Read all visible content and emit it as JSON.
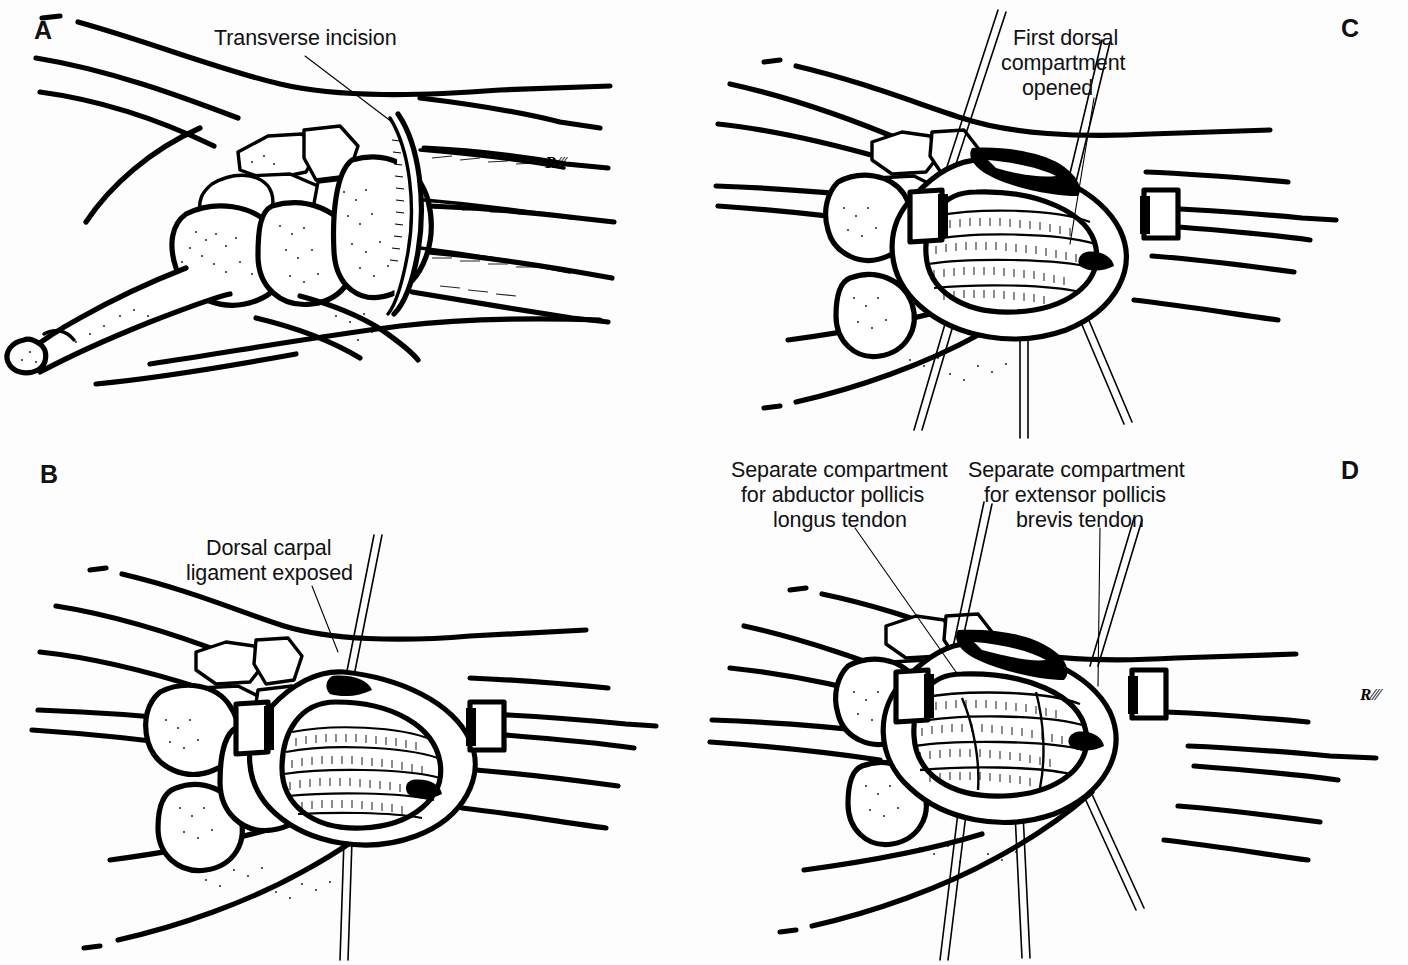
{
  "figure": {
    "background_color": "#ffffff",
    "ink_color": "#000000",
    "panels": [
      {
        "id": "a",
        "letter": "A",
        "letter_pos": {
          "x": 34,
          "y": 18
        },
        "callouts": [
          {
            "name": "transverse-incision",
            "lines": [
              "Transverse incision"
            ],
            "x": 214,
            "y": 26,
            "leader": {
              "x1": 305,
              "y1": 56,
              "x2": 392,
              "y2": 122
            }
          }
        ],
        "signature": "R.M.K.",
        "signature_pos": {
          "x": 545,
          "y": 168
        },
        "description": "Dorsal view of wrist skeleton and forearm with curved transverse skin incision marked over the radial styloid"
      },
      {
        "id": "b",
        "letter": "B",
        "letter_pos": {
          "x": 40,
          "y": 462
        },
        "callouts": [
          {
            "name": "dorsal-carpal-ligament-exposed",
            "lines": [
              "Dorsal carpal",
              "ligament exposed"
            ],
            "x": 206,
            "y": 536,
            "leader": {
              "x1": 312,
              "y1": 586,
              "x2": 338,
              "y2": 652
            }
          }
        ],
        "signature": null,
        "description": "Wound retracted with skin hooks exposing the striped dorsal carpal ligament"
      },
      {
        "id": "c",
        "letter": "C",
        "letter_pos": {
          "x": 1341,
          "y": 16
        },
        "callouts": [
          {
            "name": "first-dorsal-compartment-opened",
            "lines": [
              "First dorsal",
              "compartment",
              "opened"
            ],
            "x": 1013,
            "y": 26,
            "leader": {
              "x1": 1094,
              "y1": 98,
              "x2": 1070,
              "y2": 244
            }
          }
        ],
        "signature": null,
        "description": "First dorsal compartment incised and opened, tendons visible beneath the retinaculum"
      },
      {
        "id": "d",
        "letter": "D",
        "letter_pos": {
          "x": 1341,
          "y": 458
        },
        "callouts": [
          {
            "name": "abductor-pollicis-longus-compartment",
            "lines": [
              "Separate compartment",
              "for abductor pollicis",
              "longus tendon"
            ],
            "x": 731,
            "y": 458,
            "leader": {
              "x1": 855,
              "y1": 528,
              "x2": 956,
              "y2": 672
            }
          },
          {
            "name": "extensor-pollicis-brevis-compartment",
            "lines": [
              "Separate compartment",
              "for extensor pollicis",
              "brevis tendon"
            ],
            "x": 968,
            "y": 458,
            "leader": {
              "x1": 1100,
              "y1": 528,
              "x2": 1098,
              "y2": 686
            }
          }
        ],
        "signature": "R.M.K.",
        "signature_pos": {
          "x": 1358,
          "y": 698
        },
        "description": "Separate compartments for abductor pollicis longus and extensor pollicis brevis tendons demonstrated"
      }
    ]
  }
}
